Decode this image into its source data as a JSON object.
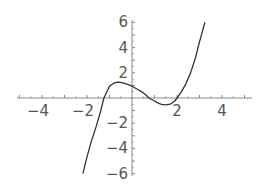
{
  "chart_data": {
    "type": "line",
    "title": "",
    "xlabel": "",
    "ylabel": "",
    "xlim": [
      -5.2,
      5.3
    ],
    "ylim": [
      -6.2,
      6.2
    ],
    "grid": false,
    "legend": null,
    "x_ticks": [
      -4,
      -2,
      2,
      4
    ],
    "y_ticks": [
      6,
      4,
      2,
      -2,
      -4,
      -6
    ],
    "x_tick_labels": [
      "-4",
      "-2",
      "2",
      "4"
    ],
    "y_tick_labels": [
      "6",
      "4",
      "2",
      "-2",
      "-4",
      "-6"
    ],
    "series": [
      {
        "name": "cubic",
        "color": "#333333",
        "x": [
          -2.18,
          -2.0,
          -1.8,
          -1.6,
          -1.4,
          -1.25,
          -1.0,
          -0.8,
          -0.6,
          -0.4,
          -0.2,
          0.0,
          0.2,
          0.4,
          0.6,
          0.75,
          0.9,
          1.1,
          1.3,
          1.5,
          1.7,
          1.9,
          2.0,
          2.2,
          2.4,
          2.6,
          2.8,
          3.0,
          3.24
        ],
        "y": [
          -6.0,
          -4.67,
          -3.39,
          -2.31,
          -1.08,
          0.0,
          0.94,
          1.2,
          1.26,
          1.2,
          1.08,
          0.94,
          0.74,
          0.52,
          0.28,
          0.0,
          -0.14,
          -0.35,
          -0.51,
          -0.55,
          -0.49,
          -0.24,
          0.0,
          0.51,
          1.14,
          1.98,
          3.07,
          4.46,
          6.0
        ]
      }
    ]
  },
  "axes": {
    "origin_px": [
      132,
      98
    ],
    "x_px_per_unit": 22.5,
    "y_px_per_unit": 12.6
  }
}
